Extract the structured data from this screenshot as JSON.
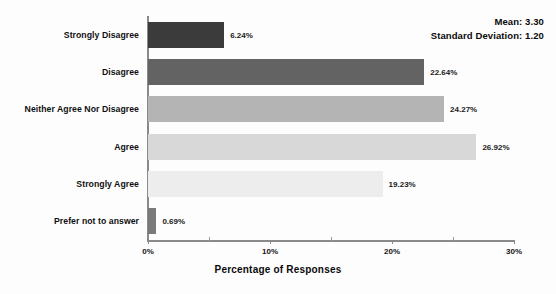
{
  "chart_data": {
    "type": "bar",
    "orientation": "horizontal",
    "title": "",
    "xlabel": "Percentage of Responses",
    "ylabel": "",
    "categories": [
      "Strongly Disagree",
      "Disagree",
      "Neither Agree Nor Disagree",
      "Agree",
      "Strongly Agree",
      "Prefer not to answer"
    ],
    "values": [
      6.24,
      22.64,
      24.27,
      26.92,
      19.23,
      0.69
    ],
    "value_labels": [
      "6.24%",
      "22.64%",
      "24.27%",
      "26.92%",
      "19.23%",
      "0.69%"
    ],
    "bar_colors": [
      "#3b3b3b",
      "#636363",
      "#b4b4b4",
      "#d8d8d8",
      "#ededed",
      "#7a7a7a"
    ],
    "xlim": [
      0,
      30
    ],
    "xticks": [
      0,
      10,
      20,
      30
    ],
    "xtick_labels": [
      "0%",
      "10%",
      "20%",
      "30%"
    ],
    "xticks_minor": [
      5,
      15,
      25
    ],
    "grid": false,
    "legend": "none",
    "annotations": {
      "mean_line": "Mean: 3.30",
      "sd_line": "Standard Deviation: 1.20"
    }
  },
  "axis": {
    "line_color": "#8a8a8a"
  }
}
